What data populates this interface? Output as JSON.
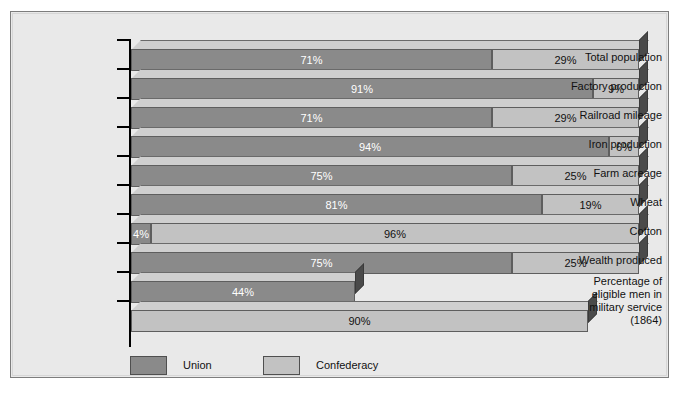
{
  "chart_data": {
    "type": "bar",
    "subtype": "stacked-horizontal-3d",
    "title": "",
    "xlabel": "",
    "ylabel": "",
    "xlim": [
      0,
      100
    ],
    "grid": false,
    "legend_position": "bottom",
    "legend": [
      {
        "name": "Union",
        "color": "#8a8a8a"
      },
      {
        "name": "Confederacy",
        "color": "#c2c2c2"
      }
    ],
    "categories": [
      "Total population",
      "Factory production",
      "Railroad mileage",
      "Iron production",
      "Farm acreage",
      "Wheat",
      "Cotton",
      "Wealth produced",
      "Percentage of eligible men in military service (1864)"
    ],
    "series": [
      {
        "name": "Union",
        "values": [
          71,
          91,
          71,
          94,
          75,
          81,
          4,
          75,
          44
        ],
        "labels": [
          "71%",
          "91%",
          "71%",
          "94%",
          "75%",
          "81%",
          "4%",
          "75%",
          "44%"
        ]
      },
      {
        "name": "Confederacy",
        "values": [
          29,
          9,
          29,
          6,
          25,
          19,
          96,
          25,
          90
        ],
        "labels": [
          "29%",
          "9%",
          "29%",
          "6%",
          "25%",
          "19%",
          "96%",
          "25%",
          "90%"
        ]
      }
    ],
    "note": "The last category is shown as two separate (non-stacked) bars: Union 44% and Confederacy 90%."
  },
  "rows": [
    {
      "label": "Total population",
      "stacked": true,
      "union": 71,
      "conf": 29,
      "union_label": "71%",
      "conf_label": "29%"
    },
    {
      "label": "Factory production",
      "stacked": true,
      "union": 91,
      "conf": 9,
      "union_label": "91%",
      "conf_label": "9%"
    },
    {
      "label": "Railroad mileage",
      "stacked": true,
      "union": 71,
      "conf": 29,
      "union_label": "71%",
      "conf_label": "29%"
    },
    {
      "label": "Iron production",
      "stacked": true,
      "union": 94,
      "conf": 6,
      "union_label": "94%",
      "conf_label": "6%"
    },
    {
      "label": "Farm acreage",
      "stacked": true,
      "union": 75,
      "conf": 25,
      "union_label": "75%",
      "conf_label": "25%"
    },
    {
      "label": "Wheat",
      "stacked": true,
      "union": 81,
      "conf": 19,
      "union_label": "81%",
      "conf_label": "19%"
    },
    {
      "label": "Cotton",
      "stacked": true,
      "union": 4,
      "conf": 96,
      "union_label": "4%",
      "conf_label": "96%"
    },
    {
      "label": "Wealth produced",
      "stacked": true,
      "union": 75,
      "conf": 25,
      "union_label": "75%",
      "conf_label": "25%"
    }
  ],
  "military_rows": {
    "label_lines": [
      "Percentage of",
      "eligible men in",
      "military service",
      "(1864)"
    ],
    "union": {
      "value": 44,
      "label": "44%"
    },
    "conf": {
      "value": 90,
      "label": "90%"
    }
  },
  "legend": {
    "union_label": "Union",
    "confederacy_label": "Confederacy"
  },
  "colors": {
    "union": "#8a8a8a",
    "confederacy": "#c2c2c2",
    "side": "#4a4a4a",
    "plot_background": "#e9e9e9",
    "frame_border": "#7d7d7d"
  }
}
